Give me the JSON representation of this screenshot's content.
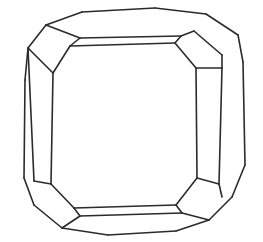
{
  "figure": {
    "title": "Truncated cube crystal form",
    "kind": "polyhedron-line-drawing",
    "domain": "diagram",
    "background_color": "#ffffff",
    "stroke_color": "#2b2b2b",
    "fill_color": "#ffffff",
    "stroke_width": 1.6,
    "canvas": {
      "width": 263,
      "height": 242
    },
    "view": "slight perspective, front-facing square face",
    "label_text": ""
  },
  "geometry": {
    "outline": "28,48 46,25 82,12 155,8 206,14 238,35 243,62 245,165 232,197 209,220 176,231 108,235 62,228 34,205 24,178 25,80",
    "front_face": "70,46 175,43 196,68 197,178 176,205 74,208 51,184 53,73",
    "facets": [
      {
        "name": "outer-silhouette",
        "role": "silhouette",
        "points": "28,48 46,25 82,12 155,8 206,14 238,35 243,62 245,165 232,197 209,220 176,231 108,235 62,228 34,205 24,178 25,80"
      },
      {
        "name": "top-band",
        "role": "edge-truncation-band",
        "points": "70,46 175,43 181,36 80,38 46,25 82,12 155,8 206,14 194,31 181,36"
      },
      {
        "name": "top-face",
        "role": "top-edge-face",
        "points": "46,25 82,12 155,8 206,14 194,31 181,36 80,38"
      },
      {
        "name": "top-strip",
        "role": "narrow-band",
        "points": "80,38 181,36 175,43 70,46"
      },
      {
        "name": "top-left-corner-facet",
        "role": "corner-octahedral-facet",
        "points": "46,25 80,38 70,46 53,73 28,48"
      },
      {
        "name": "left-band",
        "role": "edge-truncation-band",
        "points": "53,73 51,184 34,181 28,48 25,80"
      },
      {
        "name": "left-face",
        "role": "left-edge-face",
        "points": "28,48 25,80 24,178 34,181"
      },
      {
        "name": "left-strip",
        "role": "narrow-band",
        "points": "28,48 53,73 51,184 34,181 24,178 25,80"
      },
      {
        "name": "bottom-left-corner-facet",
        "role": "corner-octahedral-facet",
        "points": "34,181 51,184 74,208 80,216 62,228 34,205"
      },
      {
        "name": "bottom-band",
        "role": "edge-truncation-band",
        "points": "74,208 176,205 182,213 80,216"
      },
      {
        "name": "bottom-face",
        "role": "bottom-edge-face",
        "points": "80,216 182,213 209,220 176,231 108,235 62,228"
      },
      {
        "name": "bottom-right-corner-facet",
        "role": "corner-octahedral-facet",
        "points": "176,205 197,178 219,184 222,197 209,220 182,213"
      },
      {
        "name": "right-band",
        "role": "edge-truncation-band",
        "points": "196,68 197,178 219,184 222,68"
      },
      {
        "name": "right-face",
        "role": "right-edge-face",
        "points": "222,68 243,62 245,165 222,197 219,184"
      },
      {
        "name": "top-right-corner-facet",
        "role": "corner-octahedral-facet",
        "points": "181,36 194,31 222,55 222,68 196,68 175,43"
      },
      {
        "name": "top-right-sliver",
        "role": "narrow-corner-sliver",
        "points": "194,31 206,14 238,35 222,55"
      },
      {
        "name": "bottom-right-sliver",
        "role": "narrow-corner-sliver",
        "points": "219,184 245,165 232,197 222,197"
      }
    ],
    "edges": [
      {
        "name": "silhouette-top-left-upper",
        "from": [
          46,
          25
        ],
        "to": [
          82,
          12
        ]
      },
      {
        "name": "silhouette-top",
        "from": [
          82,
          12
        ],
        "to": [
          155,
          8
        ]
      },
      {
        "name": "silhouette-top-right-upper",
        "from": [
          155,
          8
        ],
        "to": [
          206,
          14
        ]
      },
      {
        "name": "silhouette-top-right",
        "from": [
          206,
          14
        ],
        "to": [
          238,
          35
        ]
      },
      {
        "name": "silhouette-right-upper",
        "from": [
          238,
          35
        ],
        "to": [
          243,
          62
        ]
      },
      {
        "name": "silhouette-right",
        "from": [
          243,
          62
        ],
        "to": [
          245,
          165
        ]
      },
      {
        "name": "silhouette-right-lower",
        "from": [
          245,
          165
        ],
        "to": [
          232,
          197
        ]
      },
      {
        "name": "silhouette-bottom-right",
        "from": [
          232,
          197
        ],
        "to": [
          209,
          220
        ]
      },
      {
        "name": "silhouette-bottom-right-lo",
        "from": [
          209,
          220
        ],
        "to": [
          176,
          231
        ]
      },
      {
        "name": "silhouette-bottom",
        "from": [
          176,
          231
        ],
        "to": [
          108,
          235
        ]
      },
      {
        "name": "silhouette-bottom-left-lo",
        "from": [
          108,
          235
        ],
        "to": [
          62,
          228
        ]
      },
      {
        "name": "silhouette-bottom-left",
        "from": [
          62,
          228
        ],
        "to": [
          34,
          205
        ]
      },
      {
        "name": "silhouette-left-lower",
        "from": [
          34,
          205
        ],
        "to": [
          24,
          178
        ]
      },
      {
        "name": "silhouette-left",
        "from": [
          24,
          178
        ],
        "to": [
          25,
          80
        ]
      },
      {
        "name": "silhouette-left-upper",
        "from": [
          25,
          80
        ],
        "to": [
          28,
          48
        ]
      },
      {
        "name": "silhouette-top-left",
        "from": [
          28,
          48
        ],
        "to": [
          46,
          25
        ]
      },
      {
        "name": "front-top",
        "from": [
          70,
          46
        ],
        "to": [
          175,
          43
        ]
      },
      {
        "name": "front-top-right-corner",
        "from": [
          175,
          43
        ],
        "to": [
          196,
          68
        ]
      },
      {
        "name": "front-right",
        "from": [
          196,
          68
        ],
        "to": [
          197,
          178
        ]
      },
      {
        "name": "front-bottom-right-corner",
        "from": [
          197,
          178
        ],
        "to": [
          176,
          205
        ]
      },
      {
        "name": "front-bottom",
        "from": [
          176,
          205
        ],
        "to": [
          74,
          208
        ]
      },
      {
        "name": "front-bottom-left-corner",
        "from": [
          74,
          208
        ],
        "to": [
          51,
          184
        ]
      },
      {
        "name": "front-left",
        "from": [
          51,
          184
        ],
        "to": [
          53,
          73
        ]
      },
      {
        "name": "front-top-left-corner",
        "from": [
          53,
          73
        ],
        "to": [
          70,
          46
        ]
      },
      {
        "name": "band-top-inner",
        "from": [
          80,
          38
        ],
        "to": [
          181,
          36
        ]
      },
      {
        "name": "band-top-left-join",
        "from": [
          70,
          46
        ],
        "to": [
          80,
          38
        ]
      },
      {
        "name": "band-top-right-join",
        "from": [
          175,
          43
        ],
        "to": [
          181,
          36
        ]
      },
      {
        "name": "band-top-outer-left",
        "from": [
          46,
          25
        ],
        "to": [
          80,
          38
        ]
      },
      {
        "name": "band-top-outer-right",
        "from": [
          181,
          36
        ],
        "to": [
          194,
          31
        ]
      },
      {
        "name": "band-left-inner",
        "from": [
          34,
          181
        ],
        "to": [
          28,
          48
        ]
      },
      {
        "name": "band-left-top-join",
        "from": [
          28,
          48
        ],
        "to": [
          53,
          73
        ]
      },
      {
        "name": "band-left-bottom-join",
        "from": [
          34,
          181
        ],
        "to": [
          51,
          184
        ]
      },
      {
        "name": "band-bottom-inner",
        "from": [
          80,
          216
        ],
        "to": [
          182,
          213
        ]
      },
      {
        "name": "band-bottom-left-join",
        "from": [
          74,
          208
        ],
        "to": [
          80,
          216
        ]
      },
      {
        "name": "band-bottom-right-join",
        "from": [
          176,
          205
        ],
        "to": [
          182,
          213
        ]
      },
      {
        "name": "band-bottom-outer-left",
        "from": [
          62,
          228
        ],
        "to": [
          80,
          216
        ]
      },
      {
        "name": "band-bottom-outer-right",
        "from": [
          182,
          213
        ],
        "to": [
          209,
          220
        ]
      },
      {
        "name": "band-right-inner",
        "from": [
          222,
          68
        ],
        "to": [
          219,
          184
        ]
      },
      {
        "name": "band-right-top-join",
        "from": [
          196,
          68
        ],
        "to": [
          222,
          68
        ]
      },
      {
        "name": "band-right-bottom-join",
        "from": [
          197,
          178
        ],
        "to": [
          219,
          184
        ]
      },
      {
        "name": "corner-tr-facet-edge",
        "from": [
          194,
          31
        ],
        "to": [
          222,
          55
        ]
      },
      {
        "name": "corner-tr-facet-side",
        "from": [
          222,
          55
        ],
        "to": [
          222,
          68
        ]
      },
      {
        "name": "corner-br-facet-edge",
        "from": [
          219,
          184
        ],
        "to": [
          222,
          197
        ]
      }
    ]
  },
  "metrics": {
    "facet_count": 17,
    "edge_count": 43,
    "symmetry": "pseudo 4-fold"
  }
}
